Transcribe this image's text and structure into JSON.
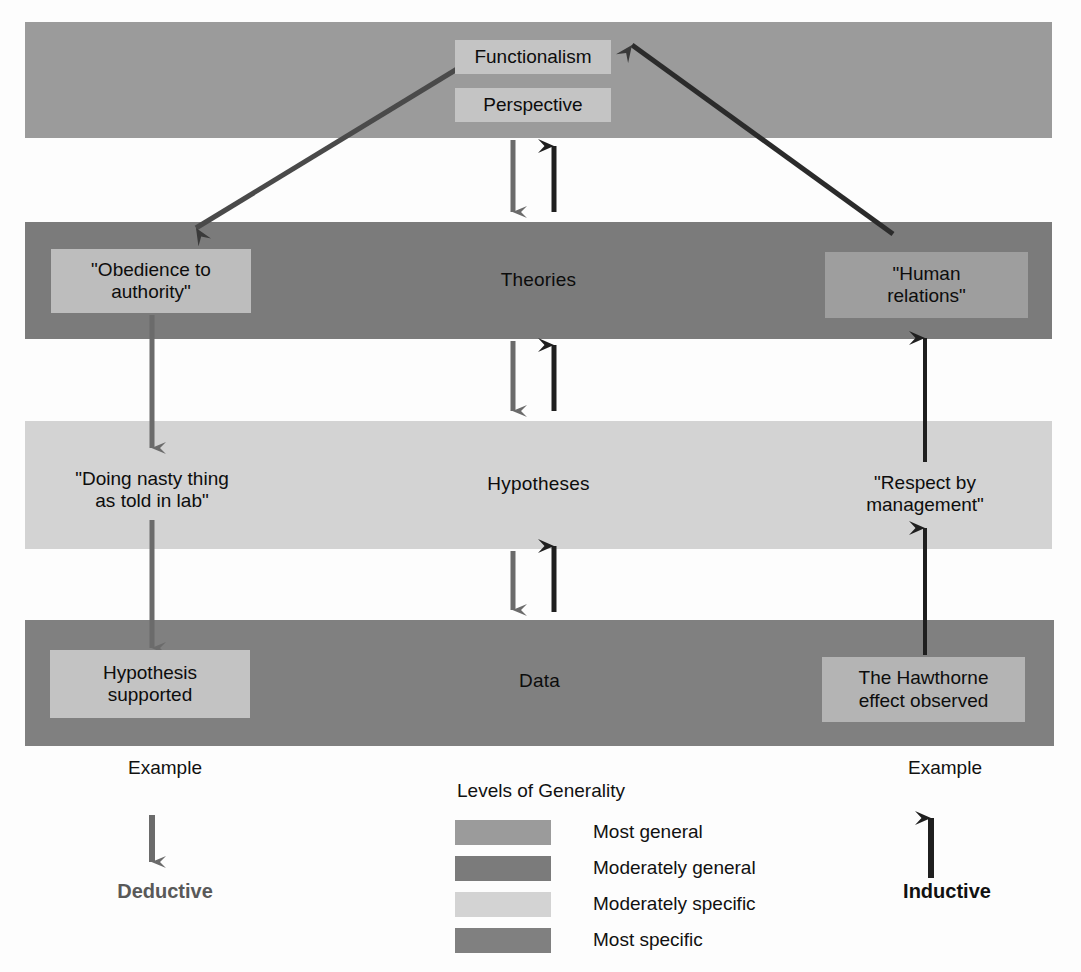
{
  "diagram": {
    "title": "Levels of Generality",
    "bands": [
      {
        "id": "most-general",
        "label": "",
        "color": "#9b9b9b"
      },
      {
        "id": "moderately-general",
        "label": "Theories",
        "color": "#7b7b7b"
      },
      {
        "id": "moderately-specific",
        "label": "Hypotheses",
        "color": "#d3d3d3"
      },
      {
        "id": "most-specific",
        "label": "Data",
        "color": "#808080"
      }
    ],
    "center_boxes": {
      "functionalism": "Functionalism",
      "perspective": "Perspective",
      "theories": "Theories",
      "hypotheses": "Hypotheses",
      "data": "Data"
    },
    "left_column": {
      "theory": "\"Obedience to\nauthority\"",
      "hypothesis": "\"Doing nasty thing\nas told in lab\"",
      "data": "Hypothesis\nsupported",
      "example_caption": "Example",
      "flow_label": "Deductive"
    },
    "right_column": {
      "theory": "\"Human\nrelations\"",
      "hypothesis": "\"Respect by\nmanagement\"",
      "data": "The Hawthorne\neffect observed",
      "example_caption": "Example",
      "flow_label": "Inductive"
    },
    "legend": {
      "title": "Levels of Generality",
      "items": [
        {
          "label": "Most general",
          "color": "#9b9b9b"
        },
        {
          "label": "Moderately general",
          "color": "#7b7b7b"
        },
        {
          "label": "Moderately specific",
          "color": "#d3d3d3"
        },
        {
          "label": "Most specific",
          "color": "#808080"
        }
      ]
    },
    "arrow_colors": {
      "deductive": "#6b6b6b",
      "inductive": "#1f1f1f"
    }
  }
}
